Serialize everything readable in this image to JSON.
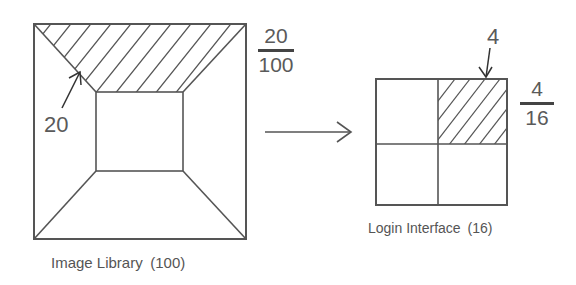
{
  "left_figure": {
    "caption": "Image Library (100)",
    "pointer_label": "20",
    "fraction": {
      "numerator": "20",
      "denominator": "100"
    }
  },
  "right_figure": {
    "caption": "Login Interface (16)",
    "pointer_label": "4",
    "fraction": {
      "numerator": "4",
      "denominator": "16"
    }
  },
  "colors": {
    "stroke": "#555555",
    "text": "#5a5a5a",
    "background": "#ffffff"
  }
}
